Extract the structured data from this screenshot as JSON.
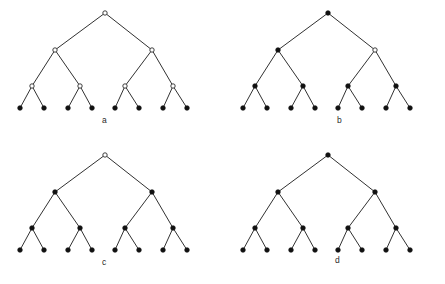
{
  "figure": {
    "type": "diagram",
    "background_color": "#ffffff",
    "edge_color": "#1a1a1a",
    "filled_node_color": "#111111",
    "open_node_fill": "#ffffff",
    "open_node_stroke": "#2a2a2a",
    "node_radius_filled": 2.3,
    "node_radius_open": 2.2,
    "tree_depth": 3,
    "leaf_count": 8,
    "internal_node_count": 7,
    "geometry": {
      "root": {
        "x": 105,
        "y": 13
      },
      "level1": [
        {
          "x": 55,
          "y": 50
        },
        {
          "x": 152,
          "y": 50
        }
      ],
      "level2": [
        {
          "x": 32,
          "y": 86
        },
        {
          "x": 80,
          "y": 86
        },
        {
          "x": 125,
          "y": 86
        },
        {
          "x": 173,
          "y": 86
        }
      ],
      "leaves": [
        {
          "x": 20,
          "y": 108
        },
        {
          "x": 44,
          "y": 108
        },
        {
          "x": 68,
          "y": 108
        },
        {
          "x": 92,
          "y": 108
        },
        {
          "x": 115,
          "y": 108
        },
        {
          "x": 139,
          "y": 108
        },
        {
          "x": 163,
          "y": 108
        },
        {
          "x": 187,
          "y": 108
        }
      ]
    },
    "panels": [
      {
        "id": "a",
        "label": "a",
        "label_x": 102,
        "label_y": 116,
        "root_state": "open",
        "level1_states": [
          "open",
          "open"
        ],
        "level2_states": [
          "open",
          "open",
          "open",
          "open"
        ],
        "leaf_states": [
          "filled",
          "filled",
          "filled",
          "filled",
          "filled",
          "filled",
          "filled",
          "filled"
        ]
      },
      {
        "id": "b",
        "label": "b",
        "label_x": 114,
        "label_y": 116,
        "root_state": "filled",
        "level1_states": [
          "filled",
          "open"
        ],
        "level2_states": [
          "filled",
          "filled",
          "filled",
          "filled"
        ],
        "leaf_states": [
          "filled",
          "filled",
          "filled",
          "filled",
          "filled",
          "filled",
          "filled",
          "filled"
        ]
      },
      {
        "id": "c",
        "label": "c",
        "label_x": 102,
        "label_y": 116,
        "root_state": "open",
        "level1_states": [
          "filled",
          "filled"
        ],
        "level2_states": [
          "filled",
          "filled",
          "filled",
          "filled"
        ],
        "leaf_states": [
          "filled",
          "filled",
          "filled",
          "filled",
          "filled",
          "filled",
          "filled",
          "filled"
        ]
      },
      {
        "id": "d",
        "label": "d",
        "label_x": 112,
        "label_y": 114,
        "root_state": "filled",
        "level1_states": [
          "filled",
          "filled"
        ],
        "level2_states": [
          "filled",
          "filled",
          "filled",
          "filled"
        ],
        "leaf_states": [
          "filled",
          "filled",
          "filled",
          "filled",
          "filled",
          "filled",
          "filled",
          "filled"
        ]
      }
    ]
  }
}
